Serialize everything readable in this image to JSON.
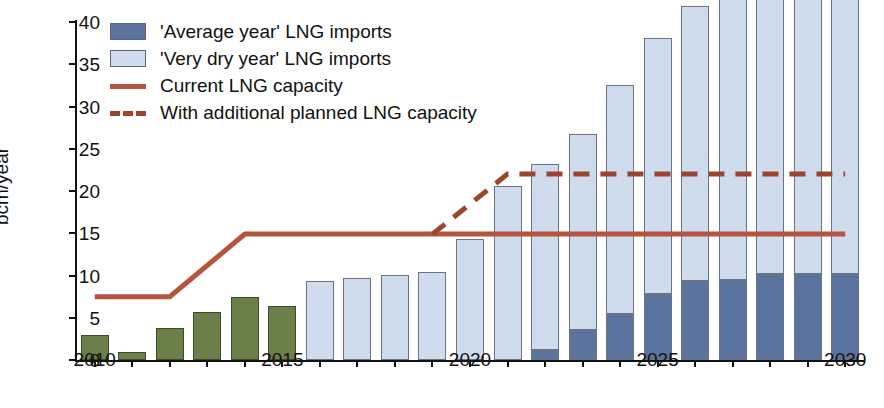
{
  "chart_data": {
    "type": "bar",
    "title": "",
    "subtitle": "",
    "xlabel": "",
    "ylabel": "bcm/year",
    "ylim": [
      0,
      40
    ],
    "ytick_values": [
      0,
      5,
      10,
      15,
      20,
      25,
      30,
      35,
      40
    ],
    "ytick_labels": [
      "0",
      "5",
      "10",
      "15",
      "20",
      "25",
      "30",
      "35",
      "40"
    ],
    "xlim": [
      2010,
      2030
    ],
    "x": [
      2010,
      2011,
      2012,
      2013,
      2014,
      2015,
      2016,
      2017,
      2018,
      2019,
      2020,
      2021,
      2022,
      2023,
      2024,
      2025,
      2026,
      2027,
      2028,
      2029,
      2030
    ],
    "xtick_labels": [
      "2010",
      "",
      "",
      "",
      "",
      "2015",
      "",
      "",
      "",
      "",
      "2020",
      "",
      "",
      "",
      "",
      "2025",
      "",
      "",
      "",
      "",
      "2030"
    ],
    "xtick_labelled_values": [
      2010,
      2015,
      2020,
      2025,
      2030
    ],
    "grid": false,
    "legend_position": "upper-left",
    "stacked": true,
    "series": [
      {
        "name": "Historic LNG imports",
        "in_legend": false,
        "color": "#6b7f48",
        "values": [
          2.9,
          0.9,
          3.8,
          5.7,
          7.4,
          6.4,
          null,
          null,
          null,
          null,
          null,
          null,
          null,
          null,
          null,
          null,
          null,
          null,
          null,
          null,
          null
        ]
      },
      {
        "name": "'Average year' LNG imports",
        "in_legend": true,
        "color": "#5a739f",
        "values": [
          null,
          null,
          null,
          null,
          null,
          null,
          0,
          0,
          0,
          0,
          0,
          0,
          1.2,
          3.6,
          5.5,
          7.8,
          9.4,
          9.5,
          10.2,
          10.2,
          10.2
        ]
      },
      {
        "name": "'Very dry year' LNG imports",
        "in_legend": true,
        "color": "#cfdcee",
        "values": [
          null,
          null,
          null,
          null,
          null,
          null,
          9.4,
          9.7,
          10.1,
          10.4,
          14.3,
          20.6,
          22.0,
          23.1,
          27.1,
          30.3,
          32.5,
          33.2,
          34.8,
          37.7,
          38.7
        ]
      }
    ],
    "lines": [
      {
        "name": "Current LNG capacity",
        "style": "solid",
        "color": "#b5543f",
        "x": [
          2010,
          2012,
          2014,
          2030
        ],
        "y": [
          7.5,
          7.5,
          14.9,
          14.9
        ]
      },
      {
        "name": "With additional planned LNG capacity",
        "style": "dashed",
        "color": "#9c4430",
        "x": [
          2019,
          2021,
          2030
        ],
        "y": [
          14.9,
          22.0,
          22.0
        ]
      }
    ]
  },
  "legend": {
    "items": [
      {
        "label": "'Average year' LNG imports",
        "swatch": "box",
        "color": "#5a739f"
      },
      {
        "label": "'Very dry year' LNG imports",
        "swatch": "box",
        "color": "#cfdcee"
      },
      {
        "label": "Current LNG capacity",
        "swatch": "solid-line",
        "color": "#b5543f"
      },
      {
        "label": "With additional planned LNG capacity",
        "swatch": "dashed-line",
        "color": "#9c4430"
      }
    ]
  }
}
